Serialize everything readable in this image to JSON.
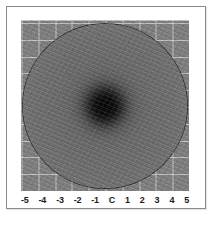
{
  "figure": {
    "kind": "beam-profile-heatmap",
    "background_color": "#ffffff",
    "frame_border_color": "#8a8a8a",
    "plot_background_color": "#7e7e7e",
    "gridline_color": "#d7d7d7",
    "tick_label_color": "#1a1a1a"
  },
  "chart_data": {
    "type": "heatmap",
    "title": "",
    "subtitle": "",
    "xlabel": "",
    "ylabel": "",
    "colormap": "grayscale",
    "grid": true,
    "legend": null,
    "x_tick_labels": [
      "-5",
      "-4",
      "-3",
      "-2",
      "-1",
      "C",
      "1",
      "2",
      "3",
      "4",
      "5"
    ],
    "x_tick_values": [
      -5,
      -4,
      -3,
      -2,
      -1,
      0,
      1,
      2,
      3,
      4,
      5
    ],
    "xlim": [
      -5,
      5
    ],
    "ylim": [
      -5,
      5
    ],
    "center_label": "C",
    "radial_profile": {
      "radius_units": "grid units",
      "radius": [
        0.0,
        0.3,
        0.5,
        0.7,
        0.9,
        1.2,
        1.5,
        2.0,
        2.5,
        3.0,
        3.5,
        4.0,
        4.5,
        4.9
      ],
      "gray_value": [
        8,
        12,
        21,
        45,
        70,
        90,
        98,
        105,
        107,
        109,
        113,
        117,
        125,
        140
      ]
    },
    "spot": {
      "center_x": 0,
      "center_y": 0,
      "disc_radius": 4.9,
      "core_radius": 0.9,
      "core_gray_value": 8,
      "field_gray_value": 126
    }
  },
  "axis": {
    "ticks": [
      {
        "label": "-5"
      },
      {
        "label": "-4"
      },
      {
        "label": "-3"
      },
      {
        "label": "-2"
      },
      {
        "label": "-1"
      },
      {
        "label": "C"
      },
      {
        "label": "1"
      },
      {
        "label": "2"
      },
      {
        "label": "3"
      },
      {
        "label": "4"
      },
      {
        "label": "5"
      }
    ]
  }
}
